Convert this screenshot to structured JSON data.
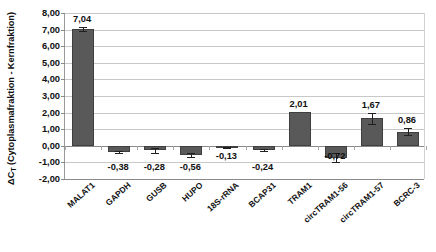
{
  "chart_data": {
    "type": "bar",
    "title": "",
    "xlabel": "",
    "ylabel": "ΔCT (Cytoplasmafraktion - Kernfraktion)",
    "ylabel_main": "ΔC",
    "ylabel_sub": "T",
    "ylabel_rest": " (Cytoplasmafraktion - Kernfraktion)",
    "ylim": [
      -2.0,
      8.0
    ],
    "ytick_step": 1.0,
    "yticks": [
      "8,00",
      "7,00",
      "6,00",
      "5,00",
      "4,00",
      "3,00",
      "2,00",
      "1,00",
      "0,00",
      "-1,00",
      "-2,00"
    ],
    "ytick_values": [
      8,
      7,
      6,
      5,
      4,
      3,
      2,
      1,
      0,
      -1,
      -2
    ],
    "grid": true,
    "legend": "none",
    "decimal_separator": ",",
    "categories": [
      "MALAT1",
      "GAPDH",
      "GUSB",
      "HUPO",
      "18S-rRNA",
      "BCAP31",
      "TRAM1",
      "circTRAM1-56",
      "circTRAM1-57",
      "BCRC-3"
    ],
    "values": [
      7.04,
      -0.38,
      -0.28,
      -0.56,
      -0.13,
      -0.24,
      2.01,
      -0.72,
      1.67,
      0.86
    ],
    "value_labels": [
      "7,04",
      "-0,38",
      "-0,28",
      "-0,56",
      "-0,13",
      "-0,24",
      "2,01",
      "-0,72",
      "1,67",
      "0,86"
    ],
    "errors": [
      0.12,
      0.04,
      0.17,
      0.11,
      0.03,
      0.06,
      0.0,
      0.28,
      0.33,
      0.2
    ],
    "bar_color": "#595959",
    "bar_border_color": "#3f3f3f",
    "grid_color": "#c8c8c8",
    "axis_color": "#8a8a8a",
    "text_color": "#111111",
    "background": "#ffffff"
  }
}
